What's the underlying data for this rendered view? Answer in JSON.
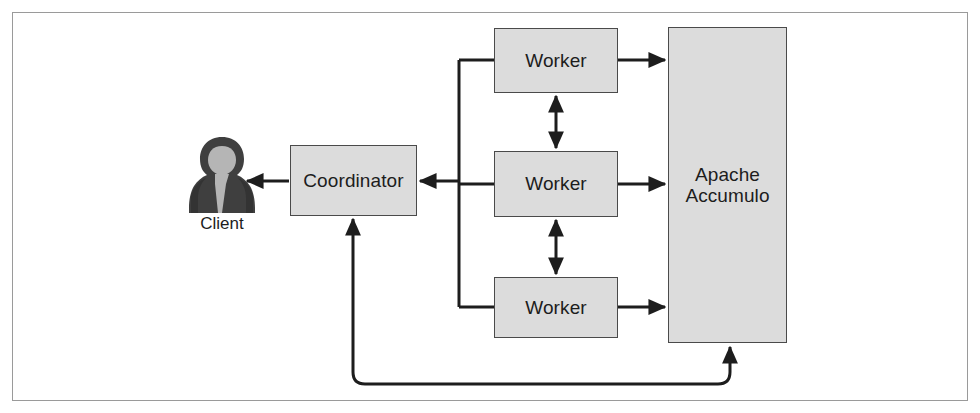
{
  "figure": {
    "frame_border_color": "#9a9a9a",
    "background_color": "#ffffff"
  },
  "style": {
    "box_fill": "#dcdcdc",
    "box_stroke": "#4a4a4a",
    "line_color": "#1d1d1d",
    "text_color": "#1d1d1d",
    "actor_dark": "#3f3f3f",
    "actor_light": "#b5b5b5"
  },
  "nodes": {
    "client": {
      "label": "Client",
      "icon": "user-silhouette-icon"
    },
    "coordinator": {
      "label": "Coordinator"
    },
    "worker_top": {
      "label": "Worker"
    },
    "worker_middle": {
      "label": "Worker"
    },
    "worker_bottom": {
      "label": "Worker"
    },
    "datastore": {
      "label": "Apache\nAccumulo",
      "line1": "Apache",
      "line2": "Accumulo"
    }
  },
  "connections": [
    {
      "id": "coordinator-to-client",
      "from": "coordinator",
      "to": "client",
      "direction": "one-way",
      "arrow_at": "client"
    },
    {
      "id": "worker-bus-to-coordinator",
      "from": "worker-bus",
      "to": "coordinator",
      "direction": "one-way",
      "arrow_at": "coordinator"
    },
    {
      "id": "bus-to-worker-top",
      "from": "worker-bus",
      "to": "worker_top",
      "direction": "plain"
    },
    {
      "id": "bus-to-worker-middle",
      "from": "worker-bus",
      "to": "worker_middle",
      "direction": "plain"
    },
    {
      "id": "bus-to-worker-bottom",
      "from": "worker-bus",
      "to": "worker_bottom",
      "direction": "plain"
    },
    {
      "id": "worker-top-to-datastore",
      "from": "worker_top",
      "to": "datastore",
      "direction": "one-way",
      "arrow_at": "datastore"
    },
    {
      "id": "worker-middle-to-datastore",
      "from": "worker_middle",
      "to": "datastore",
      "direction": "one-way",
      "arrow_at": "datastore"
    },
    {
      "id": "worker-bottom-to-datastore",
      "from": "worker_bottom",
      "to": "datastore",
      "direction": "one-way",
      "arrow_at": "datastore"
    },
    {
      "id": "worker-top-worker-middle",
      "from": "worker_top",
      "to": "worker_middle",
      "direction": "two-way"
    },
    {
      "id": "worker-middle-worker-bottom",
      "from": "worker_middle",
      "to": "worker_bottom",
      "direction": "two-way"
    },
    {
      "id": "coordinator-to-datastore-feedback",
      "from": "coordinator",
      "to": "datastore",
      "direction": "two-way",
      "routing": "rounded-bottom-loop"
    }
  ]
}
